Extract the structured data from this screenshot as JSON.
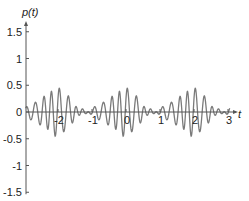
{
  "chart_data": {
    "type": "line",
    "title": "",
    "xlabel": "t",
    "ylabel": "p(t)",
    "xlim": [
      -2.95,
      3.1
    ],
    "ylim": [
      -1.5,
      1.6
    ],
    "grid": false,
    "legend": null,
    "x_ticks": [
      -2,
      -1,
      0,
      1,
      2,
      3
    ],
    "x_tick_labels": [
      "-2",
      "-1",
      "0",
      "1",
      "2",
      "3"
    ],
    "y_ticks": [
      -1.5,
      -1,
      -0.5,
      0,
      0.5,
      1,
      1.5
    ],
    "y_tick_labels": [
      "-1.5",
      "-1",
      "-0.5",
      "0",
      "0.5",
      "1",
      "1.5"
    ],
    "series": [
      {
        "name": "p(t)",
        "color": "#7a7a7a",
        "description": "Oscillating multi-frequency signal around zero, amplitude roughly ±0.3 to ±0.6, peak ≈0.57 near t≈0",
        "components": [
          {
            "amp": 0.22,
            "freq": 8.0,
            "phase": 0.0
          },
          {
            "amp": 0.16,
            "freq": 9.0,
            "phase": 0.6
          },
          {
            "amp": 0.09,
            "freq": 6.0,
            "phase": 1.3
          },
          {
            "amp": 0.06,
            "freq": 11.0,
            "phase": 2.1
          }
        ],
        "t_start": -2.95,
        "t_end": 3.05,
        "samples": 900
      }
    ]
  },
  "axes": {
    "y_title": "p(t)",
    "x_title": "t"
  }
}
